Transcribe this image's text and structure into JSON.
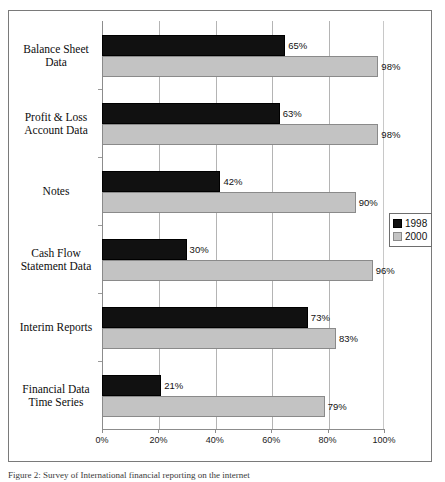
{
  "chart_data": {
    "type": "bar",
    "orientation": "horizontal",
    "title": "",
    "xlabel": "",
    "ylabel": "",
    "xlim": [
      0,
      100
    ],
    "xticks": [
      "0%",
      "20%",
      "40%",
      "60%",
      "80%",
      "100%"
    ],
    "xtick_values": [
      0,
      20,
      40,
      60,
      80,
      100
    ],
    "grid": true,
    "legend_position": "right",
    "categories": [
      "Balance Sheet Data",
      "Profit & Loss Account Data",
      "Notes",
      "Cash Flow Statement Data",
      "Interim Reports",
      "Financial Data Time Series"
    ],
    "category_lines": [
      [
        "Balance Sheet",
        "Data"
      ],
      [
        "Profit & Loss",
        "Account Data"
      ],
      [
        "Notes"
      ],
      [
        "Cash Flow",
        "Statement Data"
      ],
      [
        "Interim Reports"
      ],
      [
        "Financial Data",
        "Time Series"
      ]
    ],
    "series": [
      {
        "name": "1998",
        "color": "#111111",
        "values": [
          65,
          63,
          42,
          30,
          73,
          21
        ],
        "labels": [
          "65%",
          "63%",
          "42%",
          "30%",
          "73%",
          "21%"
        ]
      },
      {
        "name": "2000",
        "color": "#c3c3c3",
        "values": [
          98,
          98,
          90,
          96,
          83,
          79
        ],
        "labels": [
          "98%",
          "98%",
          "90%",
          "96%",
          "83%",
          "79%"
        ]
      }
    ]
  },
  "legend": {
    "entries": [
      {
        "label": "1998",
        "swatch": "black-square-swatch"
      },
      {
        "label": "2000",
        "swatch": "gray-square-swatch"
      }
    ]
  },
  "caption": {
    "text": "Figure 2: Survey of International financial reporting on the internet"
  }
}
